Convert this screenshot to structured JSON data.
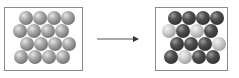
{
  "diagram": {
    "left_panel": {
      "label": "",
      "rows": [
        [
          "gray",
          "gray",
          "gray",
          "gray"
        ],
        [
          "gray",
          "gray",
          "gray",
          "gray"
        ],
        [
          "gray",
          "gray",
          "gray",
          "gray"
        ],
        [
          "gray",
          "gray",
          "gray",
          "gray"
        ]
      ]
    },
    "arrow": {
      "direction": "right"
    },
    "right_panel": {
      "label": "",
      "rows": [
        [
          "dark",
          "dark",
          "dark",
          "dark"
        ],
        [
          "light",
          "dark",
          "light",
          "dark"
        ],
        [
          "dark",
          "dark",
          "dark",
          "light"
        ],
        [
          "dark",
          "light",
          "dark",
          "dark"
        ]
      ]
    },
    "colors": {
      "border": "#8a8a8a",
      "gray": "#8c8c8c",
      "dark": "#3a3a3a",
      "light": "#b5b5b5",
      "arrow": "#555555"
    }
  }
}
